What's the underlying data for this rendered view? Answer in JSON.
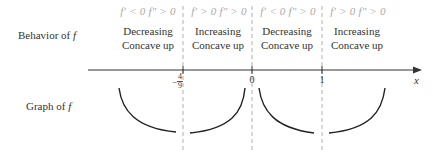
{
  "labels": {
    "behavior_prefix": "Behavior of ",
    "graph_prefix": "Graph of ",
    "f": "f",
    "x_axis": "x"
  },
  "intervals": [
    {
      "condition": "f′ < 0 f″ > 0",
      "line1": "Decreasing",
      "line2": "Concave up"
    },
    {
      "condition": "f′ > 0 f″ > 0",
      "line1": "Increasing",
      "line2": "Concave up"
    },
    {
      "condition": "f′ < 0 f″ > 0",
      "line1": "Decreasing",
      "line2": "Concave up"
    },
    {
      "condition": "f′ > 0 f″ > 0",
      "line1": "Increasing",
      "line2": "Concave up"
    }
  ],
  "ticks": [
    {
      "label_sign": "−",
      "label_num": "4",
      "label_den": "9",
      "x": 183
    },
    {
      "label": "0",
      "x": 252
    },
    {
      "label": "1",
      "x": 322
    }
  ],
  "colors": {
    "axis": "#333333",
    "dash": "#b0b0b0",
    "curve": "#222222",
    "condition_text": "#aaaaaa"
  }
}
